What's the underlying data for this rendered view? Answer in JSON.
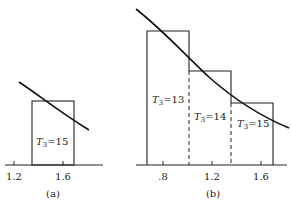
{
  "figure": {
    "panels": [
      {
        "id": "a",
        "caption": "(a)",
        "ticks": [
          "1.2",
          "1.6"
        ],
        "boxes": [
          {
            "label_main": "T",
            "label_sub": "3",
            "label_rest": "=15"
          }
        ]
      },
      {
        "id": "b",
        "caption": "(b)",
        "ticks": [
          ".8",
          "1.2",
          "1.6"
        ],
        "boxes": [
          {
            "label_main": "T",
            "label_sub": "3",
            "label_rest": "=13"
          },
          {
            "label_main": "T",
            "label_sub": "3",
            "label_rest": "=14"
          },
          {
            "label_main": "T",
            "label_sub": "3",
            "label_rest": "=15"
          }
        ]
      }
    ]
  },
  "colors": {
    "line": "#222222",
    "background": "#ffffff"
  }
}
